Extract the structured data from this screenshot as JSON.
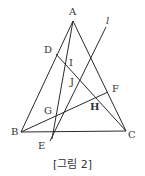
{
  "figure": {
    "caption": "[그림 2]",
    "points": {
      "A": {
        "label": "A",
        "x": 73,
        "y": 21
      },
      "B": {
        "label": "B",
        "x": 21,
        "y": 132
      },
      "C": {
        "label": "C",
        "x": 126,
        "y": 131
      },
      "D": {
        "label": "D",
        "x": 56,
        "y": 54
      },
      "E": {
        "label": "E",
        "x": 52,
        "y": 132
      },
      "F": {
        "label": "F",
        "x": 108,
        "y": 92
      },
      "G": {
        "label": "G",
        "x": 55,
        "y": 117
      },
      "H": {
        "label": "H",
        "x": 96,
        "y": 97
      },
      "I": {
        "label": "I",
        "x": 67,
        "y": 66
      },
      "J": {
        "label": "J",
        "x": 80,
        "y": 78
      }
    },
    "line_label": "l",
    "stroke_color": "#2a2a2a"
  }
}
